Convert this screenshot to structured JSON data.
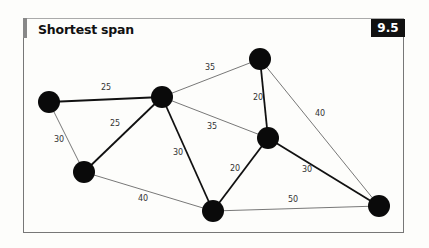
{
  "title": "Shortest span",
  "figure_number": "9.5",
  "graph": {
    "nodes": [
      {
        "id": "A"
      },
      {
        "id": "B"
      },
      {
        "id": "C"
      },
      {
        "id": "D"
      },
      {
        "id": "E"
      },
      {
        "id": "F"
      },
      {
        "id": "G"
      }
    ],
    "edges": [
      {
        "from": "A",
        "to": "B",
        "weight": "25",
        "in_span": true
      },
      {
        "from": "A",
        "to": "D",
        "weight": "30",
        "in_span": false
      },
      {
        "from": "B",
        "to": "D",
        "weight": "25",
        "in_span": true
      },
      {
        "from": "B",
        "to": "C",
        "weight": "35",
        "in_span": false
      },
      {
        "from": "B",
        "to": "F",
        "weight": "35",
        "in_span": false
      },
      {
        "from": "B",
        "to": "E",
        "weight": "30",
        "in_span": true
      },
      {
        "from": "C",
        "to": "F",
        "weight": "20",
        "in_span": true
      },
      {
        "from": "C",
        "to": "G",
        "weight": "40",
        "in_span": false
      },
      {
        "from": "F",
        "to": "E",
        "weight": "20",
        "in_span": true
      },
      {
        "from": "F",
        "to": "G",
        "weight": "30",
        "in_span": true
      },
      {
        "from": "D",
        "to": "E",
        "weight": "40",
        "in_span": false
      },
      {
        "from": "E",
        "to": "G",
        "weight": "50",
        "in_span": false
      }
    ]
  }
}
